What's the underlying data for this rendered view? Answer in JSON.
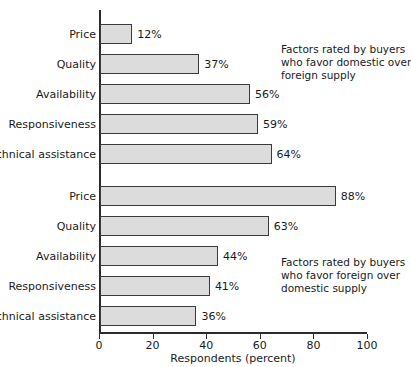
{
  "chart_data": {
    "type": "bar",
    "orientation": "horizontal",
    "title": "",
    "xlabel": "Respondents (percent)",
    "ylabel": "",
    "xlim": [
      0,
      100
    ],
    "xticks": [
      0,
      20,
      40,
      60,
      80,
      100
    ],
    "xtick_labels": [
      "0",
      "20",
      "40",
      "60",
      "80",
      "100"
    ],
    "grid": false,
    "legend": null,
    "categories": [
      "Price",
      "Quality",
      "Availability",
      "Responsiveness",
      "Technical assistance"
    ],
    "groups": [
      {
        "name": "domestic",
        "annotation": [
          "Factors rated by buyers",
          "who favor domestic over",
          "foreign supply"
        ],
        "bars": [
          {
            "label": "Price",
            "value": 12,
            "value_label": "12%"
          },
          {
            "label": "Quality",
            "value": 37,
            "value_label": "37%"
          },
          {
            "label": "Availability",
            "value": 56,
            "value_label": "56%"
          },
          {
            "label": "Responsiveness",
            "value": 59,
            "value_label": "59%"
          },
          {
            "label": "Technical assistance",
            "value": 64,
            "value_label": "64%"
          }
        ]
      },
      {
        "name": "foreign",
        "annotation": [
          "Factors rated by buyers",
          "who favor foreign over",
          "domestic supply"
        ],
        "bars": [
          {
            "label": "Price",
            "value": 88,
            "value_label": "88%"
          },
          {
            "label": "Quality",
            "value": 63,
            "value_label": "63%"
          },
          {
            "label": "Availability",
            "value": 44,
            "value_label": "44%"
          },
          {
            "label": "Responsiveness",
            "value": 41,
            "value_label": "41%"
          },
          {
            "label": "Technical assistance",
            "value": 36,
            "value_label": "36%"
          }
        ]
      }
    ],
    "colors": {
      "bar_fill": "#dcdcdc",
      "bar_border": "#3a3a3a",
      "axis": "#2b2b2b",
      "text": "#1a1a1a",
      "background": "#ffffff"
    }
  }
}
